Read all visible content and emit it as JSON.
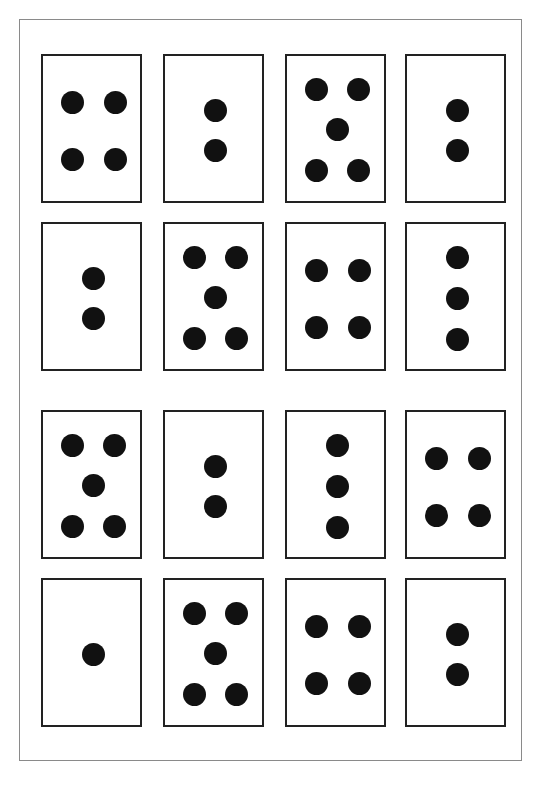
{
  "colors": {
    "dot": "#111111",
    "card_border": "#222222",
    "frame_border": "#8a8a8a",
    "background": "#ffffff"
  },
  "layout": {
    "columns_x": [
      41,
      163,
      285,
      405
    ],
    "rows_y": [
      54,
      222,
      410,
      578
    ]
  },
  "cards": [
    {
      "row": 0,
      "col": 0,
      "dots": 4,
      "label": "4"
    },
    {
      "row": 0,
      "col": 1,
      "dots": 2,
      "label": "2"
    },
    {
      "row": 0,
      "col": 2,
      "dots": 5,
      "label": "5"
    },
    {
      "row": 0,
      "col": 3,
      "dots": 2,
      "label": "2"
    },
    {
      "row": 1,
      "col": 0,
      "dots": 2,
      "label": "2"
    },
    {
      "row": 1,
      "col": 1,
      "dots": 5,
      "label": "5"
    },
    {
      "row": 1,
      "col": 2,
      "dots": 4,
      "label": "4"
    },
    {
      "row": 1,
      "col": 3,
      "dots": 3,
      "label": "3"
    },
    {
      "row": 2,
      "col": 0,
      "dots": 5,
      "label": "5"
    },
    {
      "row": 2,
      "col": 1,
      "dots": 2,
      "label": "2"
    },
    {
      "row": 2,
      "col": 2,
      "dots": 3,
      "label": "3"
    },
    {
      "row": 2,
      "col": 3,
      "dots": 4,
      "label": "4"
    },
    {
      "row": 3,
      "col": 0,
      "dots": 1,
      "label": "1"
    },
    {
      "row": 3,
      "col": 1,
      "dots": 5,
      "label": "5"
    },
    {
      "row": 3,
      "col": 2,
      "dots": 4,
      "label": "4"
    },
    {
      "row": 3,
      "col": 3,
      "dots": 2,
      "label": "2"
    }
  ],
  "patterns": {
    "1": [
      [
        50,
        74
      ]
    ],
    "2": [
      [
        50,
        54
      ],
      [
        50,
        94
      ]
    ],
    "3": [
      [
        50,
        33
      ],
      [
        50,
        74
      ],
      [
        50,
        115
      ]
    ],
    "4": [
      [
        29,
        46
      ],
      [
        72,
        46
      ],
      [
        29,
        103
      ],
      [
        72,
        103
      ]
    ],
    "5": [
      [
        29,
        33
      ],
      [
        71,
        33
      ],
      [
        50,
        73
      ],
      [
        29,
        114
      ],
      [
        71,
        114
      ]
    ]
  }
}
